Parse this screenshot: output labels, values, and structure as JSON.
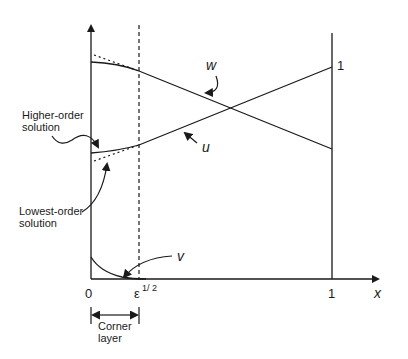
{
  "diagram": {
    "type": "asymptotic-solution-sketch",
    "axes": {
      "x_label": "x",
      "x_ticks": [
        "0",
        "ε",
        "1"
      ],
      "x_tick_eps_exponent": "1/ 2",
      "right_boundary_value_label": "1"
    },
    "curves": {
      "w": {
        "label": "w"
      },
      "u": {
        "label": "u"
      },
      "v": {
        "label": "v"
      }
    },
    "annotations": {
      "higher_order": {
        "line1": "Higher-order",
        "line2": "solution"
      },
      "lowest_order": {
        "line1": "Lowest-order",
        "line2": "solution"
      },
      "corner_layer": {
        "line1": "Corner",
        "line2": "layer"
      }
    },
    "colors": {
      "ink": "#1a1a1a",
      "background": "#ffffff"
    }
  }
}
